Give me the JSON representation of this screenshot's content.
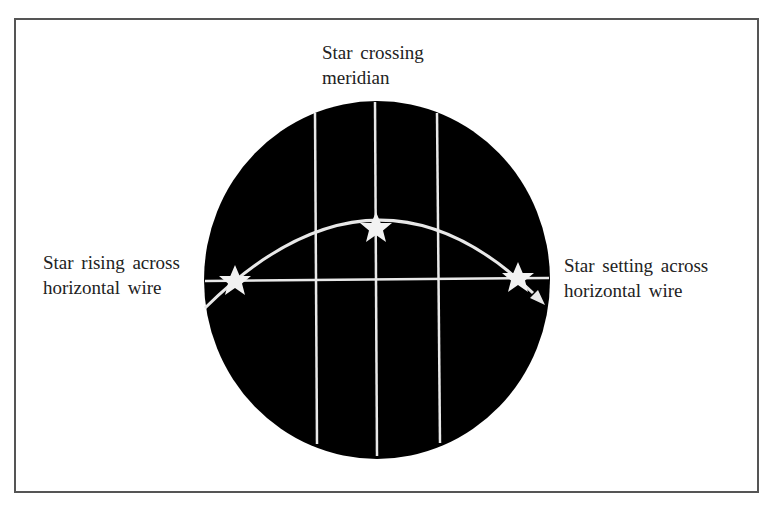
{
  "labels": {
    "top_line1": "Star crossing",
    "top_line2": "meridian",
    "left_line1": "Star rising across",
    "left_line2": "horizontal wire",
    "right_line1": "Star setting across",
    "right_line2": "horizontal wire"
  },
  "colors": {
    "field": "#000000",
    "wire": "#e8e8e8",
    "star": "#f2f2f2",
    "frame": "#555555"
  }
}
